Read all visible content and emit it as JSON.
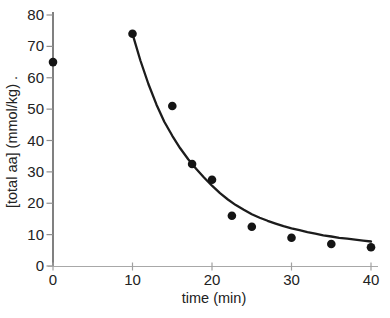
{
  "chart_data": {
    "type": "scatter",
    "title": "",
    "xlabel": "time (min)",
    "ylabel": "[total aa] (mmol/kg) .",
    "xlim": [
      0,
      40
    ],
    "ylim": [
      0,
      80
    ],
    "xticks": [
      0,
      10,
      20,
      30,
      40
    ],
    "yticks": [
      0,
      10,
      20,
      30,
      40,
      50,
      60,
      70,
      80
    ],
    "grid": false,
    "legend": "none",
    "series": [
      {
        "name": "measured total amino acids",
        "type": "scatter",
        "points": [
          [
            0,
            65
          ],
          [
            10,
            74
          ],
          [
            15,
            51
          ],
          [
            17.5,
            32.5
          ],
          [
            20,
            27.5
          ],
          [
            22.5,
            16
          ],
          [
            25,
            12.5
          ],
          [
            30,
            9
          ],
          [
            35,
            7
          ],
          [
            40,
            6
          ]
        ]
      },
      {
        "name": "fitted decay curve",
        "type": "line",
        "points": [
          [
            10,
            74
          ],
          [
            11,
            65.5
          ],
          [
            12,
            58
          ],
          [
            13,
            51.5
          ],
          [
            14,
            46
          ],
          [
            15,
            41.5
          ],
          [
            16,
            37.5
          ],
          [
            17,
            34
          ],
          [
            18,
            31
          ],
          [
            19,
            28.2
          ],
          [
            20,
            25.6
          ],
          [
            21,
            23.2
          ],
          [
            22,
            21.2
          ],
          [
            23,
            19.4
          ],
          [
            24,
            17.9
          ],
          [
            25,
            16.5
          ],
          [
            26,
            15.4
          ],
          [
            27,
            14.4
          ],
          [
            28,
            13.5
          ],
          [
            29,
            12.7
          ],
          [
            30,
            12.0
          ],
          [
            31,
            11.4
          ],
          [
            32,
            10.8
          ],
          [
            33,
            10.3
          ],
          [
            34,
            9.8
          ],
          [
            35,
            9.4
          ],
          [
            36,
            9.0
          ],
          [
            37,
            8.7
          ],
          [
            38,
            8.4
          ],
          [
            39,
            8.1
          ],
          [
            40,
            7.8
          ]
        ]
      }
    ]
  },
  "colors": {
    "background": "#ffffff",
    "point": "#141414",
    "curve": "#1c1c1c",
    "y_axis": "#4a4a4a",
    "y_tick": "#8f8f8f",
    "x_axis": "#a8a8a8",
    "x_tick": "#a0a0a0",
    "label_text": "#222222"
  }
}
